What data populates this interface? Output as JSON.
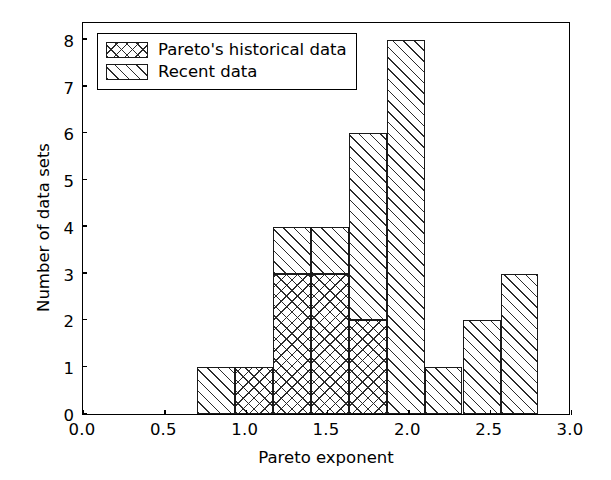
{
  "chart_data": {
    "type": "bar",
    "subtype": "stacked-histogram",
    "title": "",
    "xlabel": "Pareto exponent",
    "ylabel": "Number of data sets",
    "xlim": [
      0.0,
      3.0
    ],
    "ylim": [
      0,
      8.4
    ],
    "grid": false,
    "legend_position": "upper left",
    "xticks": [
      0.0,
      0.5,
      1.0,
      1.5,
      2.0,
      2.5,
      3.0
    ],
    "xticklabels": [
      "0.0",
      "0.5",
      "1.0",
      "1.5",
      "2.0",
      "2.5",
      "3.0"
    ],
    "yticks": [
      0,
      1,
      2,
      3,
      4,
      5,
      6,
      7,
      8
    ],
    "yticklabels": [
      "0",
      "1",
      "2",
      "3",
      "4",
      "5",
      "6",
      "7",
      "8"
    ],
    "bin_edges": [
      0.7,
      0.933,
      1.167,
      1.4,
      1.633,
      1.867,
      2.1,
      2.333,
      2.567,
      2.8
    ],
    "bin_centers": [
      0.817,
      1.05,
      1.283,
      1.517,
      1.75,
      1.983,
      2.217,
      2.45,
      2.683
    ],
    "series": [
      {
        "name": "Pareto's historical data",
        "hatch": "cross",
        "values": [
          0,
          1,
          3,
          3,
          2,
          0,
          0,
          0,
          0
        ]
      },
      {
        "name": "Recent data",
        "hatch": "forward-diagonal",
        "values": [
          1,
          0,
          1,
          1,
          4,
          8,
          1,
          2,
          3
        ]
      }
    ],
    "totals": [
      1,
      1,
      4,
      4,
      6,
      8,
      1,
      2,
      3
    ]
  },
  "legend": {
    "entries": [
      {
        "label": "Pareto's historical data",
        "swatch": "cross-hatch-swatch"
      },
      {
        "label": "Recent data",
        "swatch": "diagonal-hatch-swatch"
      }
    ]
  },
  "axes": {
    "xlabel": "Pareto exponent",
    "ylabel": "Number of data sets"
  },
  "colors": {
    "line": "#000000",
    "hatch": "#2b2b2b",
    "background": "#ffffff"
  }
}
